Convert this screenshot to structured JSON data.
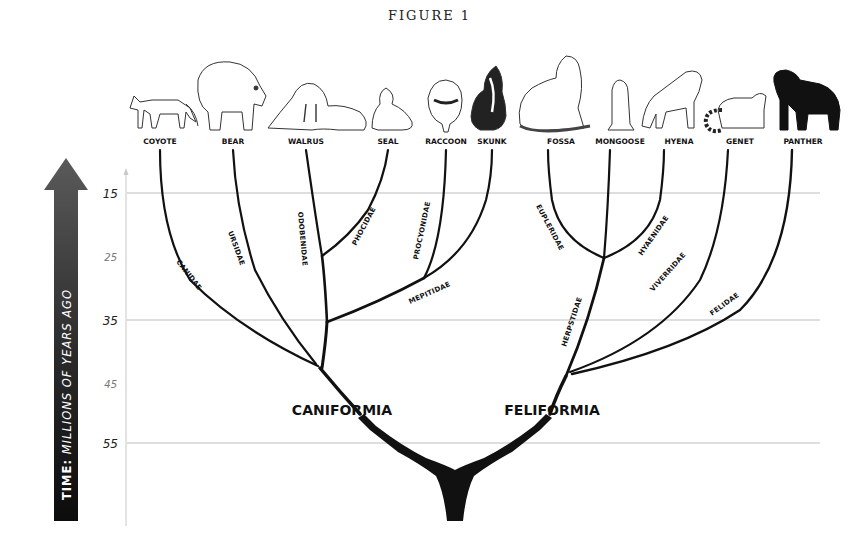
{
  "figure": {
    "title": "FIGURE 1"
  },
  "axis": {
    "label_prefix": "TIME:",
    "label_rest": " MILLIONS OF YEARS AGO",
    "ticks": [
      {
        "value": "15",
        "y": 193,
        "major": true
      },
      {
        "value": "25",
        "y": 256,
        "major": false
      },
      {
        "value": "35",
        "y": 320,
        "major": true
      },
      {
        "value": "45",
        "y": 383,
        "major": false
      },
      {
        "value": "55",
        "y": 443,
        "major": true
      }
    ]
  },
  "animals": [
    {
      "name": "COYOTE",
      "x": 160
    },
    {
      "name": "BEAR",
      "x": 233
    },
    {
      "name": "WALRUS",
      "x": 306
    },
    {
      "name": "SEAL",
      "x": 388
    },
    {
      "name": "RACCOON",
      "x": 446
    },
    {
      "name": "SKUNK",
      "x": 492
    },
    {
      "name": "FOSSA",
      "x": 561
    },
    {
      "name": "MONGOOSE",
      "x": 620
    },
    {
      "name": "HYENA",
      "x": 679
    },
    {
      "name": "GENET",
      "x": 740
    },
    {
      "name": "PANTHER",
      "x": 803
    }
  ],
  "families": [
    {
      "name": "CANIDAE",
      "x": 176,
      "y": 262,
      "rotate": 52
    },
    {
      "name": "URSIDAE",
      "x": 231,
      "y": 232,
      "rotate": 70
    },
    {
      "name": "ODOBENIDAE",
      "x": 297,
      "y": 212,
      "rotate": 85
    },
    {
      "name": "PHOCIDAE",
      "x": 356,
      "y": 245,
      "rotate": -62
    },
    {
      "name": "PROCYONIDAE",
      "x": 418,
      "y": 258,
      "rotate": -78
    },
    {
      "name": "MEPITIDAE",
      "x": 410,
      "y": 302,
      "rotate": -24
    },
    {
      "name": "EUPLERIDAE",
      "x": 537,
      "y": 207,
      "rotate": 62
    },
    {
      "name": "HYAENIDAE",
      "x": 640,
      "y": 255,
      "rotate": -55
    },
    {
      "name": "HERPSTIDAE",
      "x": 565,
      "y": 346,
      "rotate": -72
    },
    {
      "name": "VIVERRIDAE",
      "x": 653,
      "y": 290,
      "rotate": -48
    },
    {
      "name": "FELIDAE",
      "x": 713,
      "y": 314,
      "rotate": -36
    }
  ],
  "clades": [
    {
      "name": "CANIFORMIA",
      "x": 342,
      "y": 415
    },
    {
      "name": "FELIFORMIA",
      "x": 552,
      "y": 415
    }
  ],
  "colors": {
    "branch": "#111111",
    "grid": "#bdbdbd",
    "arrow_top": "#5a5a5a",
    "arrow_bottom": "#0c0c0c"
  }
}
